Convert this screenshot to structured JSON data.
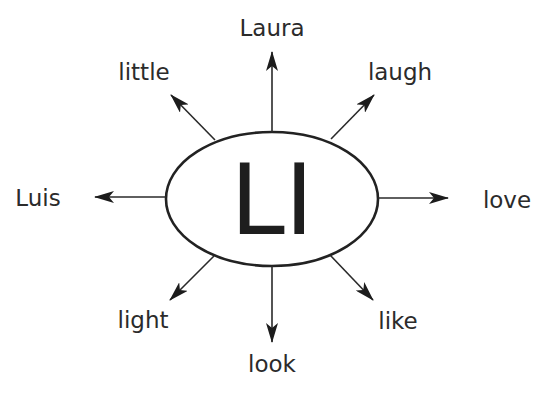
{
  "diagram": {
    "type": "word-web",
    "center": {
      "label": "LI"
    },
    "words": [
      {
        "id": "up",
        "label": "Laura"
      },
      {
        "id": "up-right",
        "label": "laugh"
      },
      {
        "id": "right",
        "label": "love"
      },
      {
        "id": "down-right",
        "label": "like"
      },
      {
        "id": "down",
        "label": "look"
      },
      {
        "id": "down-left",
        "label": "light"
      },
      {
        "id": "left",
        "label": "Luis"
      },
      {
        "id": "up-left",
        "label": "little"
      }
    ],
    "colors": {
      "stroke": "#2a2a2a",
      "text": "#2b2b2b",
      "background": "#ffffff"
    }
  }
}
